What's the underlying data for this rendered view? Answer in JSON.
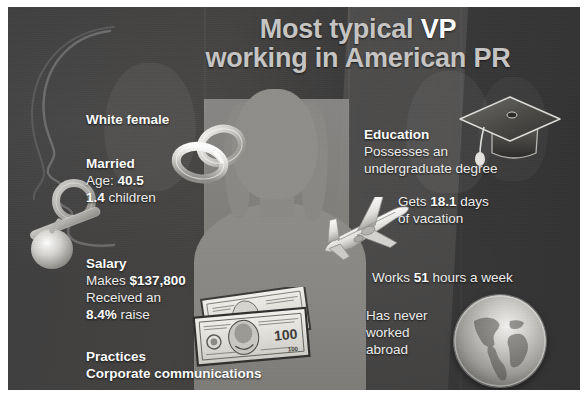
{
  "poster": {
    "title": {
      "line1_prefix": "Most typical ",
      "line1_highlight": "VP",
      "line2": "working in American PR"
    },
    "colors": {
      "board_background": "#3a3a3a",
      "title_text": "#c7c6c4",
      "title_highlight": "#ffffff",
      "body_text": "#efefee",
      "silhouette": "#8e8d8a",
      "page_background": "#ffffff"
    },
    "facts": {
      "demographic": {
        "heading": "White female"
      },
      "family": {
        "heading": "Married",
        "age_label": "Age: ",
        "age_value": "40.5",
        "children_value": "1.4",
        "children_label": " children"
      },
      "salary": {
        "heading": "Salary",
        "makes_label": "Makes ",
        "makes_value": "$137,800",
        "raise_prefix": "Received an",
        "raise_value": "8.4%",
        "raise_suffix": " raise"
      },
      "practice": {
        "heading": "Practices",
        "area": "Corporate communications"
      },
      "education": {
        "heading": "Education",
        "line1": "Possesses an",
        "line2": "undergraduate degree"
      },
      "vacation": {
        "prefix": "Gets ",
        "value": "18.1",
        "suffix": " days",
        "line2": "of vacation"
      },
      "hours": {
        "prefix": "Works ",
        "value": "51",
        "suffix": " hours a week"
      },
      "abroad": {
        "line1": "Has never",
        "line2": "worked",
        "line3": "abroad"
      }
    },
    "icons": {
      "rings": "wedding-rings-icon",
      "pacifier": "pacifier-icon",
      "graduation_cap": "graduation-cap-icon",
      "airplane": "airplane-icon",
      "money": "hundred-dollar-bills-icon",
      "globe": "globe-icon",
      "banknote_denomination": "100"
    }
  }
}
